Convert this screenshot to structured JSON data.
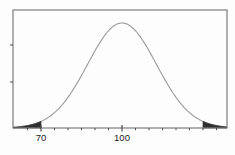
{
  "chart_data": {
    "type": "line",
    "subtype": "normal-distribution-curve",
    "title": "",
    "xlabel": "",
    "ylabel": "",
    "mean": 100,
    "sd": 15,
    "x_range": [
      59.6,
      138.9
    ],
    "x_tick_labels": [
      {
        "value": 70,
        "label": "70"
      },
      {
        "value": 100,
        "label": "100"
      }
    ],
    "minor_tick_step": 5,
    "minor_tick_range": [
      60,
      135
    ],
    "shaded_regions": [
      {
        "from": 59.6,
        "to": 70,
        "name": "left-tail-below-70"
      },
      {
        "from": 130,
        "to": 138.9,
        "name": "right-tail-above-130"
      }
    ],
    "curve_points": [
      {
        "x": 60,
        "rel_height": 0.007
      },
      {
        "x": 65,
        "rel_height": 0.023
      },
      {
        "x": 70,
        "rel_height": 0.063
      },
      {
        "x": 75,
        "rel_height": 0.146
      },
      {
        "x": 80,
        "rel_height": 0.292
      },
      {
        "x": 85,
        "rel_height": 0.5
      },
      {
        "x": 90,
        "rel_height": 0.735
      },
      {
        "x": 95,
        "rel_height": 0.926
      },
      {
        "x": 100,
        "rel_height": 1.0
      },
      {
        "x": 105,
        "rel_height": 0.926
      },
      {
        "x": 110,
        "rel_height": 0.735
      },
      {
        "x": 115,
        "rel_height": 0.5
      },
      {
        "x": 120,
        "rel_height": 0.292
      },
      {
        "x": 125,
        "rel_height": 0.146
      },
      {
        "x": 130,
        "rel_height": 0.063
      },
      {
        "x": 135,
        "rel_height": 0.023
      }
    ],
    "y_axis_unlabeled_tick_count": 2,
    "legend": "none",
    "grid": false,
    "colors": {
      "curve": "#9a9a9a",
      "frame": "#7d7d7d",
      "tick": "#4a4a4a",
      "shade": "#2f2f2f",
      "label": "#222222",
      "background": "#fdfdfd"
    }
  }
}
